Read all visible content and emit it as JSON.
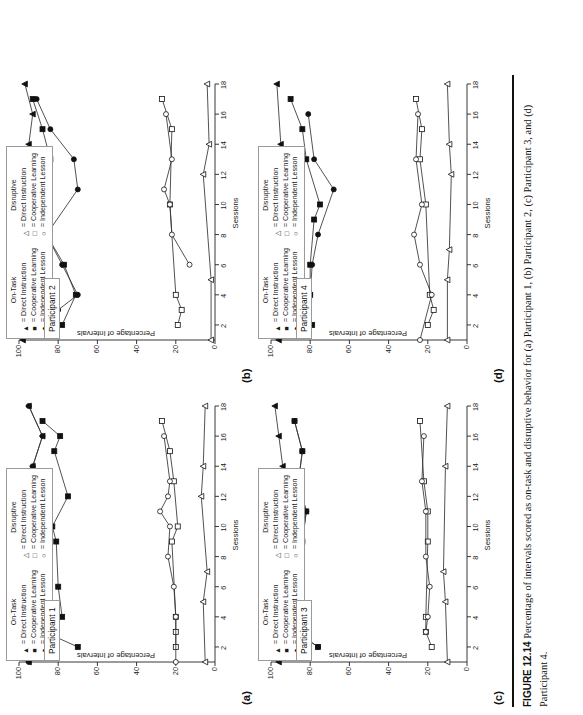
{
  "figure": {
    "number": "FIGURE 12.14",
    "caption": "Percentage of intervals scored as on-task and disruptive behavior for (a) Participant 1, (b) Participant 2, (c) Participant 3, and (d) Participant 4."
  },
  "legend": {
    "on_task_header": "On-Task",
    "disruptive_header": "Disruptive",
    "on_task": [
      {
        "glyph": "▲",
        "label": "= Direct Instruction"
      },
      {
        "glyph": "■",
        "label": "= Cooperative Learning"
      },
      {
        "glyph": "●",
        "label": "= Independent Lesson"
      }
    ],
    "disruptive": [
      {
        "glyph": "△",
        "label": "= Direct Instruction"
      },
      {
        "glyph": "□",
        "label": "= Cooperative Learning"
      },
      {
        "glyph": "○",
        "label": "= Independent Lesson"
      }
    ]
  },
  "axes": {
    "y_title": "Percentage of Intervals",
    "x_title": "Sessions",
    "y_ticks": [
      "100",
      "80",
      "60",
      "40",
      "20",
      "0"
    ],
    "x_ticks": [
      "2",
      "4",
      "6",
      "8",
      "10",
      "12",
      "14",
      "16",
      "18"
    ],
    "ylim": [
      0,
      100
    ],
    "xlim": [
      1,
      18
    ]
  },
  "panels": [
    {
      "key": "a",
      "label": "(a)",
      "participant": "Participant 1"
    },
    {
      "key": "b",
      "label": "(b)",
      "participant": "Participant 2"
    },
    {
      "key": "c",
      "label": "(c)",
      "participant": "Participant 3"
    },
    {
      "key": "d",
      "label": "(d)",
      "participant": "Participant 4"
    }
  ],
  "chart_data": [
    {
      "type": "line",
      "panel": "a",
      "title": "Participant 1",
      "xlabel": "Sessions",
      "ylabel": "Percentage of Intervals",
      "xlim": [
        1,
        18
      ],
      "ylim": [
        0,
        100
      ],
      "grid": false,
      "legend_position": "top-left",
      "series": [
        {
          "name": "On-Task Direct Instruction",
          "marker": "filled-triangle",
          "x": [
            1,
            4,
            5,
            7,
            9,
            11,
            13,
            14,
            16,
            18
          ],
          "y": [
            95,
            92,
            91,
            92,
            88,
            88,
            89,
            93,
            88,
            95
          ]
        },
        {
          "name": "On-Task Cooperative Learning",
          "marker": "filled-square",
          "x": [
            2,
            3,
            4,
            6,
            9,
            10,
            12,
            15,
            16,
            17
          ],
          "y": [
            70,
            87,
            78,
            80,
            81,
            83,
            75,
            82,
            79,
            88
          ]
        },
        {
          "name": "On-Task Independent Lesson",
          "marker": "filled-circle",
          "x": [
            1,
            4,
            5,
            7,
            9,
            11,
            13,
            14,
            16,
            18
          ],
          "y": [
            95,
            92,
            91,
            92,
            88,
            88,
            89,
            93,
            88,
            95
          ]
        },
        {
          "name": "Disruptive Direct Instruction",
          "marker": "open-triangle",
          "x": [
            1,
            5,
            7,
            12,
            14,
            18
          ],
          "y": [
            5,
            6,
            4,
            7,
            6,
            5
          ]
        },
        {
          "name": "Disruptive Cooperative Learning",
          "marker": "open-square",
          "x": [
            2,
            3,
            4,
            9,
            10,
            13,
            15,
            17
          ],
          "y": [
            20,
            20,
            20,
            22,
            19,
            21,
            23,
            27
          ]
        },
        {
          "name": "Disruptive Independent Lesson",
          "marker": "open-circle",
          "x": [
            1,
            4,
            6,
            8,
            10,
            11,
            12,
            13,
            16
          ],
          "y": [
            20,
            20,
            21,
            24,
            23,
            28,
            24,
            23,
            26
          ]
        }
      ]
    },
    {
      "type": "line",
      "panel": "b",
      "title": "Participant 2",
      "xlabel": "Sessions",
      "ylabel": "Percentage of Intervals",
      "xlim": [
        1,
        18
      ],
      "ylim": [
        0,
        100
      ],
      "grid": false,
      "legend_position": "top-left",
      "series": [
        {
          "name": "On-Task Direct Instruction",
          "marker": "filled-triangle",
          "x": [
            1,
            5,
            7,
            9,
            12,
            14,
            16,
            18
          ],
          "y": [
            98,
            92,
            90,
            93,
            95,
            95,
            93,
            97
          ]
        },
        {
          "name": "On-Task Cooperative Learning",
          "marker": "filled-square",
          "x": [
            2,
            4,
            6,
            8,
            10,
            11,
            13,
            15,
            17
          ],
          "y": [
            78,
            71,
            77,
            86,
            87,
            85,
            84,
            88,
            93
          ]
        },
        {
          "name": "On-Task Independent Lesson",
          "marker": "filled-circle",
          "x": [
            3,
            4,
            6,
            8,
            11,
            13,
            15,
            17
          ],
          "y": [
            80,
            70,
            78,
            86,
            70,
            72,
            84,
            91
          ]
        },
        {
          "name": "Disruptive Direct Instruction",
          "marker": "open-triangle",
          "x": [
            1,
            5,
            12,
            14,
            18
          ],
          "y": [
            2,
            2,
            6,
            3,
            4
          ]
        },
        {
          "name": "Disruptive Cooperative Learning",
          "marker": "open-square",
          "x": [
            2,
            3,
            4,
            10,
            15,
            17
          ],
          "y": [
            19,
            17,
            20,
            23,
            22,
            27
          ]
        },
        {
          "name": "Disruptive Independent Lesson",
          "marker": "open-circle",
          "x": [
            6,
            8,
            10,
            11,
            13,
            16
          ],
          "y": [
            13,
            22,
            23,
            26,
            22,
            25
          ]
        }
      ]
    },
    {
      "type": "line",
      "panel": "c",
      "title": "Participant 3",
      "xlabel": "Sessions",
      "ylabel": "Percentage of Intervals",
      "xlim": [
        1,
        18
      ],
      "ylim": [
        0,
        100
      ],
      "grid": false,
      "legend_position": "top-left",
      "series": [
        {
          "name": "On-Task Direct Instruction",
          "marker": "filled-triangle",
          "x": [
            1,
            4,
            7,
            9,
            11,
            13,
            14,
            16,
            18
          ],
          "y": [
            96,
            88,
            92,
            93,
            92,
            93,
            94,
            96,
            98
          ]
        },
        {
          "name": "On-Task Cooperative Learning",
          "marker": "filled-square",
          "x": [
            2,
            3,
            4,
            6,
            9,
            11,
            13,
            15,
            17
          ],
          "y": [
            76,
            87,
            88,
            86,
            84,
            82,
            86,
            84,
            88
          ]
        },
        {
          "name": "On-Task Independent Lesson",
          "marker": "filled-circle",
          "x": [
            2,
            3,
            4,
            6,
            9,
            11,
            13,
            15,
            17
          ],
          "y": [
            76,
            87,
            88,
            86,
            84,
            82,
            86,
            84,
            88
          ]
        },
        {
          "name": "Disruptive Direct Instruction",
          "marker": "open-triangle",
          "x": [
            1,
            5,
            7,
            14,
            18
          ],
          "y": [
            10,
            11,
            12,
            11,
            10
          ]
        },
        {
          "name": "Disruptive Cooperative Learning",
          "marker": "open-square",
          "x": [
            2,
            3,
            4,
            9,
            11,
            13,
            17
          ],
          "y": [
            18,
            21,
            21,
            20,
            20,
            22,
            24
          ]
        },
        {
          "name": "Disruptive Independent Lesson",
          "marker": "open-circle",
          "x": [
            3,
            4,
            6,
            8,
            11,
            13,
            16
          ],
          "y": [
            21,
            20,
            19,
            21,
            21,
            23,
            22
          ]
        }
      ]
    },
    {
      "type": "line",
      "panel": "d",
      "title": "Participant 4",
      "xlabel": "Sessions",
      "ylabel": "Percentage of Intervals",
      "xlim": [
        1,
        18
      ],
      "ylim": [
        0,
        100
      ],
      "grid": false,
      "legend_position": "top-left",
      "series": [
        {
          "name": "On-Task Direct Instruction",
          "marker": "filled-triangle",
          "x": [
            1,
            5,
            7,
            9,
            12,
            14,
            18
          ],
          "y": [
            96,
            93,
            92,
            93,
            94,
            95,
            97
          ]
        },
        {
          "name": "On-Task Cooperative Learning",
          "marker": "filled-square",
          "x": [
            2,
            3,
            4,
            6,
            9,
            10,
            13,
            15,
            17
          ],
          "y": [
            79,
            82,
            80,
            80,
            78,
            75,
            82,
            84,
            90
          ]
        },
        {
          "name": "On-Task Independent Lesson",
          "marker": "filled-circle",
          "x": [
            4,
            6,
            8,
            11,
            13,
            16
          ],
          "y": [
            80,
            79,
            76,
            68,
            78,
            81
          ]
        },
        {
          "name": "Disruptive Direct Instruction",
          "marker": "open-triangle",
          "x": [
            1,
            5,
            7,
            12,
            14,
            18
          ],
          "y": [
            10,
            10,
            9,
            8,
            9,
            10
          ]
        },
        {
          "name": "Disruptive Cooperative Learning",
          "marker": "open-square",
          "x": [
            2,
            3,
            4,
            10,
            13,
            15,
            17
          ],
          "y": [
            20,
            17,
            19,
            21,
            24,
            23,
            26
          ]
        },
        {
          "name": "Disruptive Independent Lesson",
          "marker": "open-circle",
          "x": [
            1,
            4,
            6,
            8,
            10,
            13,
            16
          ],
          "y": [
            24,
            18,
            24,
            27,
            23,
            26,
            25
          ]
        }
      ]
    }
  ]
}
